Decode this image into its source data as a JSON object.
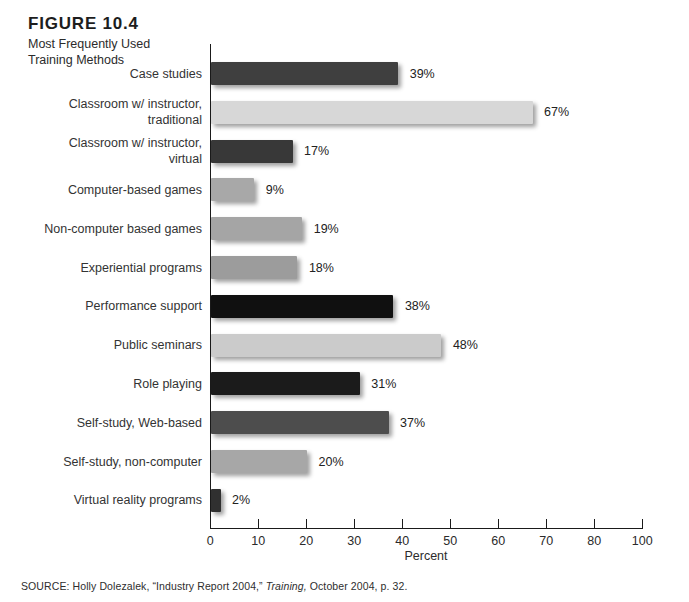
{
  "figure": {
    "label": "FIGURE 10.4",
    "subtitle_line1": "Most Frequently Used",
    "subtitle_line2": "Training Methods"
  },
  "source": {
    "prefix": "SOURCE: Holly Dolezalek, “Industry Report 2004,” ",
    "journal": "Training,",
    "suffix": " October 2004, p. 32."
  },
  "chart_data": {
    "type": "bar",
    "orientation": "horizontal",
    "title": "Most Frequently Used Training Methods",
    "xlabel": "Percent",
    "categories": [
      "Case studies",
      "Classroom w/ instructor,\ntraditional",
      "Classroom w/ instructor,\nvirtual",
      "Computer-based games",
      "Non-computer based games",
      "Experiential programs",
      "Performance support",
      "Public seminars",
      "Role playing",
      "Self-study, Web-based",
      "Self-study, non-computer",
      "Virtual reality programs"
    ],
    "values": [
      39,
      67,
      17,
      9,
      19,
      18,
      38,
      48,
      31,
      37,
      20,
      2
    ],
    "value_labels": [
      "39%",
      "67%",
      "17%",
      "9%",
      "19%",
      "18%",
      "38%",
      "48%",
      "31%",
      "37%",
      "20%",
      "2%"
    ],
    "bar_colors": [
      "#3f3f3f",
      "#d7d7d7",
      "#383838",
      "#a8a8a8",
      "#a5a5a5",
      "#9c9c9c",
      "#101010",
      "#cbcbcb",
      "#1b1b1b",
      "#4d4d4d",
      "#a7a7a7",
      "#303030"
    ],
    "x_tick_labels": [
      "0",
      "10",
      "20",
      "30",
      "40",
      "50",
      "60",
      "70",
      "80",
      "100"
    ],
    "grid": false,
    "legend": "none",
    "axis_color": "#1a1a1a"
  }
}
